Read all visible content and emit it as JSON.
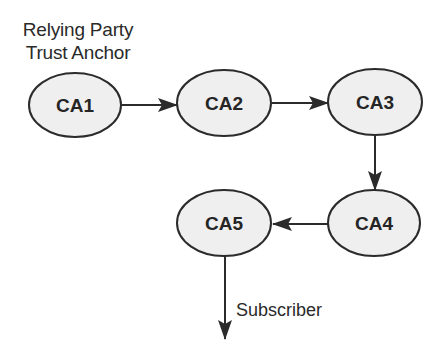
{
  "caption": {
    "line1": "Relying Party",
    "line2": "Trust Anchor"
  },
  "nodes": [
    {
      "id": "CA1",
      "label": "CA1",
      "cx": 75,
      "cy": 105
    },
    {
      "id": "CA2",
      "label": "CA2",
      "cx": 224,
      "cy": 103
    },
    {
      "id": "CA3",
      "label": "CA3",
      "cx": 375,
      "cy": 102
    },
    {
      "id": "CA4",
      "label": "CA4",
      "cx": 374,
      "cy": 223
    },
    {
      "id": "CA5",
      "label": "CA5",
      "cx": 224,
      "cy": 223
    }
  ],
  "edges": [
    {
      "from": "CA1",
      "to": "CA2"
    },
    {
      "from": "CA2",
      "to": "CA3"
    },
    {
      "from": "CA3",
      "to": "CA4"
    },
    {
      "from": "CA4",
      "to": "CA5"
    },
    {
      "from": "CA5",
      "to": "Subscriber"
    }
  ],
  "edge_labels": {
    "subscriber": "Subscriber"
  },
  "colors": {
    "node_fill": "#efefef",
    "stroke": "#2b2b2b",
    "text": "#252525"
  }
}
